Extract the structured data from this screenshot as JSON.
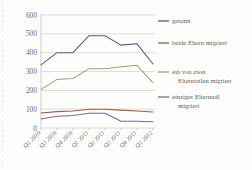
{
  "chart_data": {
    "type": "line",
    "title": "",
    "xlabel": "",
    "ylabel": "",
    "categories": [
      "Q2 2010",
      "Q3 2010",
      "Q4 2010",
      "Q1 2011",
      "Q2 2011",
      "Q3 2011",
      "Q4 2011",
      "Q1 2012"
    ],
    "ylim": [
      0,
      600
    ],
    "yticks": [
      0,
      100,
      200,
      300,
      400,
      500,
      600
    ],
    "grid": true,
    "legend_position": "right",
    "series": [
      {
        "name": "gesamt",
        "color": "#4a5f86",
        "values": [
          335,
          400,
          400,
          490,
          490,
          440,
          447,
          340
        ]
      },
      {
        "name": "beide Eltern migriert",
        "color": "#9e5c46",
        "values": [
          80,
          87,
          90,
          100,
          100,
          95,
          90,
          85
        ]
      },
      {
        "name": "ein von zwei Elternteilen migriert",
        "color": "#a5a57a",
        "values": [
          205,
          258,
          263,
          315,
          315,
          325,
          333,
          240
        ]
      },
      {
        "name": "einziger Elternteil migriert",
        "color": "#7b6a92",
        "values": [
          48,
          62,
          66,
          78,
          78,
          36,
          36,
          33
        ]
      }
    ]
  },
  "legend": {
    "entries": [
      {
        "label": "gesamt",
        "lines": [
          "gesamt"
        ]
      },
      {
        "label": "beide Eltern migriert",
        "lines": [
          "beide Eltern migriert"
        ]
      },
      {
        "label": "ein von zwei Elternteilen migriert",
        "lines": [
          "ein von zwei",
          "Elternteilen migriert"
        ]
      },
      {
        "label": "einziger Elternteil migriert",
        "lines": [
          "einziger Elternteil",
          "migriert"
        ]
      }
    ]
  },
  "axis": {
    "ytick_labels": [
      "600",
      "500",
      "400",
      "300",
      "200",
      "100",
      "0"
    ],
    "xtick_labels": [
      "Q2 2010",
      "Q3 2010",
      "Q4 2010",
      "Q1 2011",
      "Q2 2011",
      "Q3 2011",
      "Q4 2011",
      "Q1 2012"
    ]
  }
}
